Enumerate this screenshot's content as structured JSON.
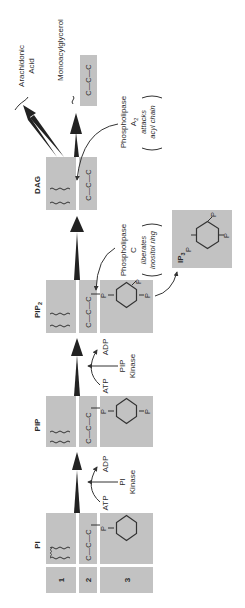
{
  "diagram": {
    "molecules": {
      "pi": {
        "label": "PI"
      },
      "pip": {
        "label": "PIP"
      },
      "pip2": {
        "label": "PIP",
        "subscript": "2"
      },
      "dag": {
        "label": "DAG"
      },
      "ip3": {
        "label": "IP",
        "subscript": "3"
      },
      "arachidonic_acid": {
        "line1": "Arachidonic",
        "line2": "Acid"
      },
      "monoacylglycerol": {
        "label": "Monoacylglycerol"
      }
    },
    "row_labels": [
      "1",
      "2",
      "3"
    ],
    "glycerol": "C—C—C",
    "phosphate": "P",
    "enzymes": {
      "pi_kinase": {
        "line1": "PI",
        "line2": "Kinase",
        "input": "ATP",
        "output": "ADP"
      },
      "pip_kinase": {
        "line1": "PIP",
        "line2": "Kinase",
        "input": "ATP",
        "output": "ADP"
      },
      "phospholipase_c": {
        "line1": "Phospholipase",
        "line2": "C",
        "note1": "liberates",
        "note2": "inositol ring"
      },
      "phospholipase_a2": {
        "line1": "Phospholipase",
        "line2": "A",
        "subscript": "2",
        "note1": "attacks",
        "note2": "acyl chain"
      }
    }
  }
}
